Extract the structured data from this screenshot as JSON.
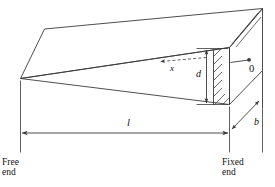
{
  "figure": {
    "name": "tapered-cantilever-beam-diagram",
    "stroke_color": "#3a3a3a",
    "text_color": "#111111",
    "background_color": "#ffffff"
  },
  "labels": {
    "free_end_line1": "Free",
    "free_end_line2": "end",
    "fixed_end_line1": "Fixed",
    "fixed_end_line2": "end",
    "length": "l",
    "depth": "d",
    "width": "b",
    "distance_x": "x",
    "origin": "0"
  },
  "dimensions": {
    "length_label": "l",
    "depth_label": "d",
    "width_label": "b",
    "coordinate_label": "x",
    "origin_label": "0"
  }
}
